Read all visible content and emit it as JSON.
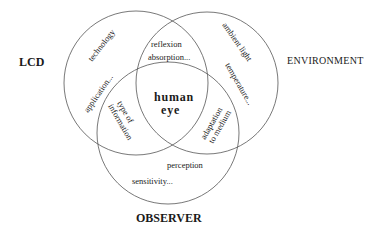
{
  "diagram": {
    "type": "venn",
    "sets": [
      {
        "id": "lcd",
        "label": "LCD",
        "circle": {
          "cx": 136,
          "cy": 83,
          "r": 72
        }
      },
      {
        "id": "environment",
        "label": "ENVIRONMENT",
        "circle": {
          "cx": 207,
          "cy": 83,
          "r": 71
        }
      },
      {
        "id": "observer",
        "label": "OBSERVER",
        "circle": {
          "cx": 168,
          "cy": 133,
          "r": 71
        }
      }
    ],
    "regions": {
      "lcd_only": [
        "technology",
        "application..."
      ],
      "environment_only": [
        "ambient light",
        "temperature..."
      ],
      "observer_only": [
        "perception",
        "sensitivity..."
      ],
      "lcd_environment": [
        "reflexion",
        "absorption..."
      ],
      "lcd_observer": [
        "type of",
        "information"
      ],
      "environment_observer": [
        "adaptation",
        "to medium"
      ],
      "center": [
        "human",
        "eye"
      ]
    },
    "colors": {
      "stroke": "#555555",
      "text": "#1a1a1a",
      "background": "#ffffff"
    }
  }
}
